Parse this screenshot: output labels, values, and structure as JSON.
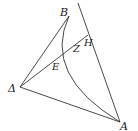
{
  "diagram": {
    "type": "geometric-figure",
    "labels": {
      "B": "B",
      "H": "H",
      "Z": "Z",
      "E": "E",
      "Delta": "Δ",
      "A": "A"
    },
    "points": {
      "B": [
        69,
        16
      ],
      "A": [
        120,
        122
      ],
      "Delta": [
        20,
        87
      ],
      "E": [
        52,
        63
      ],
      "Z": [
        79,
        44
      ],
      "H": [
        84,
        41
      ]
    },
    "colors": {
      "stroke": "#333333",
      "background": "#ffffff"
    }
  }
}
